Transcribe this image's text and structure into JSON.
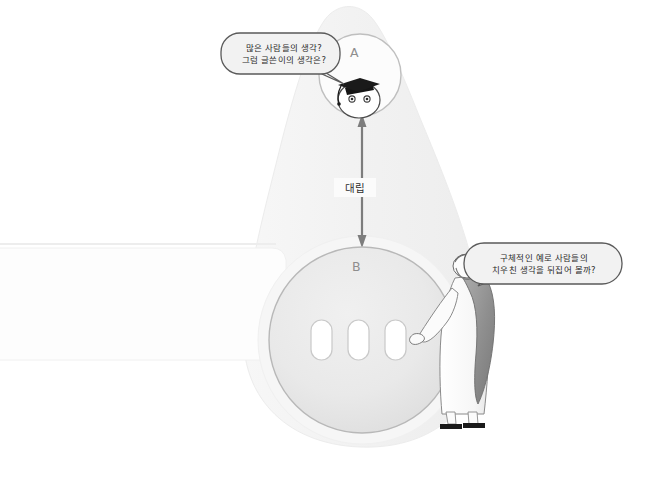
{
  "illustration": {
    "title": "Argument structure diagram with two opposing circles",
    "background_shape": {
      "name": "funnel-silhouette",
      "fill": "#f4f4f4"
    },
    "side_panel": {
      "name": "left-band",
      "fill": "#fdfdfd"
    },
    "nodes": [
      {
        "id": "A",
        "label": "A",
        "label_color": "#8e8e8e",
        "fill": "#fcfcfc",
        "stroke": "#bfbfbf",
        "cx": 360,
        "cy": 75,
        "r": 41
      },
      {
        "id": "B",
        "label": "B",
        "label_color": "#8e8e8e",
        "fill": "#e9e9e9",
        "stroke": "#b8b8b8",
        "cx": 362,
        "cy": 340,
        "r": 93
      }
    ],
    "connector": {
      "name": "opposition-arrow",
      "label": "대립",
      "type": "double-headed-vertical-arrow",
      "color": "#7d7d7d",
      "from_node": "A",
      "to_node": "B"
    },
    "bubbles": [
      {
        "id": "bubble-a",
        "speaker": "graduate-character",
        "lines": [
          "많은 사람들의 생각?",
          "그럼 글쓴이의 생각은?"
        ],
        "fill": "#f2f2f2",
        "stroke": "#5a5a5a",
        "text_color": "#2b2b2b",
        "tail_direction": "down-right"
      },
      {
        "id": "bubble-b",
        "speaker": "philosopher-character",
        "lines": [
          "구체적인 예로 사람들의",
          "치우친 생각을 뒤집어 볼까?"
        ],
        "fill": "#f2f2f2",
        "stroke": "#5a5a5a",
        "text_color": "#2b2b2b",
        "tail_direction": "down-left"
      }
    ],
    "characters": [
      {
        "id": "graduate-character",
        "name": "graduate-cap-face",
        "description": "round white face with two dot eyes wearing a black graduation cap with tassel",
        "cap_color": "#1a1a1a",
        "face_fill": "#ffffff"
      },
      {
        "id": "philosopher-character",
        "name": "philosopher-figure",
        "description": "elderly bearded figure in white robe with gray cloak and sandals pointing at circle B",
        "robe_fill": "#fdfdfd",
        "cloak_fill": "#9b9b9b",
        "sandal_color": "#1a1a1a"
      }
    ],
    "inner_slots": {
      "name": "pill-slots",
      "count": 3,
      "fill": "#ffffff",
      "stroke": "#c9c9c9"
    }
  }
}
